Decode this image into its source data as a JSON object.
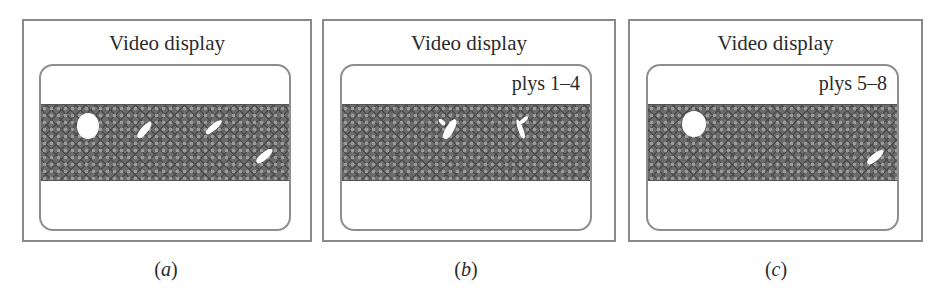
{
  "panels": [
    {
      "id": "a",
      "title": "Video display",
      "screen_label": "",
      "caption": "(a)",
      "caption_letter": "a",
      "features": [
        "round-spot",
        "streak",
        "streak",
        "streak"
      ]
    },
    {
      "id": "b",
      "title": "Video display",
      "screen_label": "plys 1–4",
      "caption": "(b)",
      "caption_letter": "b",
      "features": [
        "streak",
        "streak"
      ]
    },
    {
      "id": "c",
      "title": "Video display",
      "screen_label": "plys 5–8",
      "caption": "(c)",
      "caption_letter": "c",
      "features": [
        "round-spot",
        "streak"
      ]
    }
  ],
  "colors": {
    "frame": "#8a8a8a",
    "band": "#6a6a6a",
    "defect": "#ffffff",
    "text": "#2a2a2a"
  }
}
